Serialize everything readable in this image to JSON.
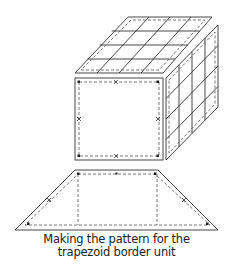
{
  "caption": {
    "line1": "Making the pattern for the",
    "line2": "trapezoid border unit"
  },
  "colors": {
    "stroke": "#333333",
    "dash": "#555555",
    "background": "#ffffff"
  },
  "figure": {
    "top_face_grid": "4x4",
    "right_face_grid": "4x4",
    "front_face": "plain square with dashed seam line and marks",
    "trapezoid": "border unit pattern with dashed seam line and marks"
  }
}
